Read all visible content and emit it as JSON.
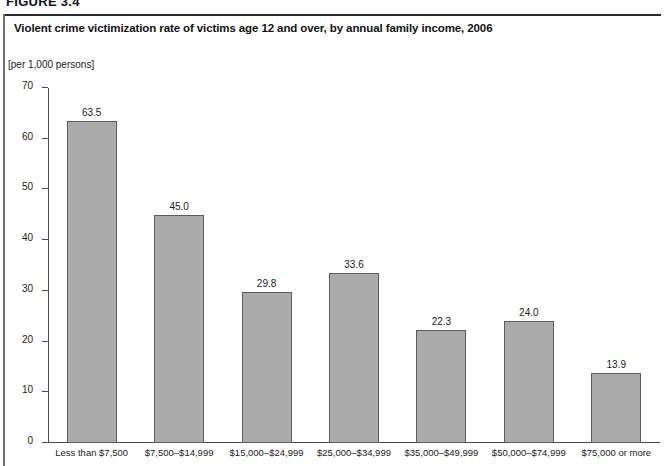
{
  "figure_number": "FIGURE 3.4",
  "panel": {
    "title": "Violent crime victimization rate of victims age 12 and over, by annual family income, 2006"
  },
  "chart_data": {
    "type": "bar",
    "title": "Violent crime victimization rate of victims age 12 and over, by annual family income, 2006",
    "subtitle": "",
    "units_label": "[per 1,000 persons]",
    "xlabel": "",
    "ylabel": "[per 1,000 persons]",
    "categories": [
      "Less than $7,500",
      "$7,500–$14,999",
      "$15,000–$24,999",
      "$25,000–$34,999",
      "$35,000–$49,999",
      "$50,000–$74,999",
      "$75,000 or more"
    ],
    "values": [
      63.5,
      45.0,
      29.8,
      33.6,
      22.3,
      24.0,
      13.9
    ],
    "value_labels": [
      "63.5",
      "45.0",
      "29.8",
      "33.6",
      "22.3",
      "24.0",
      "13.9"
    ],
    "ylim": [
      0,
      70
    ],
    "yticks": [
      0,
      10,
      20,
      30,
      40,
      50,
      60,
      70
    ],
    "ytick_labels": [
      "0",
      "10",
      "20",
      "30",
      "40",
      "50",
      "60",
      "70"
    ],
    "grid": false,
    "legend": null,
    "legend_position": "none",
    "bar_color": "#ababab",
    "bar_border_color": "#5d5d5d",
    "axis_color": "#4a4a4a",
    "text_color": "#1a1a1a"
  }
}
